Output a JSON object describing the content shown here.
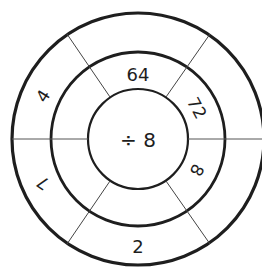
{
  "diagram": {
    "type": "division-wheel",
    "center": {
      "label": "÷ 8",
      "operation": "divide",
      "operand": 8
    },
    "colors": {
      "stroke": "#1e1e1e",
      "background": "#ffffff"
    },
    "middle_ring": [
      {
        "position": "top",
        "value": "64"
      },
      {
        "position": "upper-right",
        "value": "72"
      },
      {
        "position": "lower-right",
        "value": "8"
      },
      {
        "position": "bottom",
        "value": ""
      },
      {
        "position": "lower-left",
        "value": ""
      },
      {
        "position": "upper-left",
        "value": ""
      }
    ],
    "outer_ring": [
      {
        "position": "top",
        "value": ""
      },
      {
        "position": "upper-right",
        "value": ""
      },
      {
        "position": "lower-right",
        "value": ""
      },
      {
        "position": "bottom",
        "value": "2"
      },
      {
        "position": "lower-left",
        "value": "7"
      },
      {
        "position": "upper-left",
        "value": "4"
      }
    ]
  }
}
